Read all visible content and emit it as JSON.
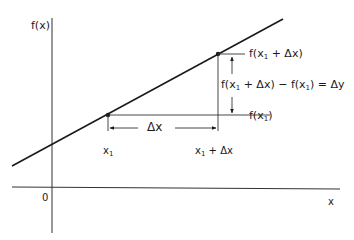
{
  "diagram": {
    "axes": {
      "y_label": "f(x)",
      "x_label": "x",
      "origin_label": "0"
    },
    "points": [
      {
        "name": "x1",
        "x_label_base": "x",
        "x_label_sub": "1"
      },
      {
        "name": "x1+dx",
        "x_label_base": "x",
        "x_label_sub": "1",
        "x_label_suffix": " + Δx"
      }
    ],
    "labels": {
      "delta_x": "Δx",
      "f_x1_plus_dx_prefix": "f(x",
      "f_x1_plus_dx_sub": "1",
      "f_x1_plus_dx_suffix": " + Δx)",
      "f_x1_prefix": "f(x",
      "f_x1_sub": "1",
      "f_x1_suffix": ")",
      "delta_y_eq_part1": "f(x",
      "delta_y_eq_sub1": "1",
      "delta_y_eq_part2": " + Δx) − f(x",
      "delta_y_eq_sub2": "1",
      "delta_y_eq_part3": ") = Δy"
    },
    "colors": {
      "line": "#1a1a1a",
      "axis": "#333333",
      "background": "#ffffff"
    }
  }
}
